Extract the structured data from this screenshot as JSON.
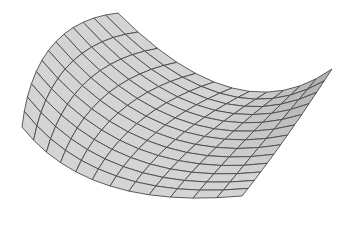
{
  "figure": {
    "kind": "saddle-surface-mesh",
    "background": "#ffffff",
    "surface_fill_light": "#d4d4d4",
    "surface_fill_dark": "#9a9a9a",
    "grid_line_color": "#4a4a4a",
    "grid_u_cells": 12,
    "grid_v_cells": 13,
    "corners": {
      "back_top": [
        118,
        13
      ],
      "right_tip": [
        332,
        69
      ],
      "front_left": [
        22,
        127
      ],
      "front_bottom": [
        242,
        196
      ]
    },
    "edge_controls": {
      "top_edge_mid": [
        232,
        88
      ],
      "left_edge_mid": [
        52,
        46
      ],
      "right_edge_mid": [
        284,
        140
      ],
      "bottom_edge_mid": [
        110,
        186
      ]
    }
  }
}
